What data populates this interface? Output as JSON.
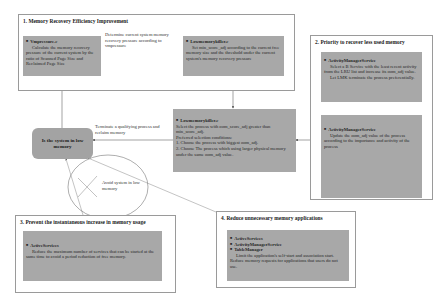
{
  "sections": [
    {
      "title": "1. Memory Recovery Efficiency Improvement",
      "boxes": [
        {
          "head": "Vmpressure.c",
          "lines": [
            "Calculate the memory recovery pressure of the current system by the ratio of Scanned Page Size and Reclaimed Page Size"
          ]
        },
        {
          "head": "Lowmemorykiller.c",
          "lines": [
            "Set min_score_adj according to the current free memory size and the threshold under the current system's memory recovery pressure"
          ]
        }
      ],
      "connector_label": "Determine current system memory recovery pressure according to vmpressure"
    },
    {
      "title": "2. Priority to recover less used memory",
      "boxes": [
        {
          "head": "ActivityManagerService",
          "lines": [
            "Select a B Service with the least recent activity from the LRU list and increase its oom_adj value.",
            "Let LMK terminate the process preferentially."
          ]
        },
        {
          "head": "ActivityManagerService",
          "lines": [
            "Update the oom_adj value of the process according to the importance and activity of the process"
          ]
        }
      ]
    },
    {
      "title": "3. Prevent the instantaneous increase in memory usage",
      "boxes": [
        {
          "head": "ActiveServices",
          "lines": [
            "Reduce the maximum number of services that can be started at the same time to avoid a period reduction of free memory."
          ]
        }
      ]
    },
    {
      "title": "4. Reduce unnecessary memory applications",
      "heads": [
        "ActiveServices",
        "ActivityManagerService",
        "TableManager"
      ],
      "lines": [
        "Limit the application's self-start and association start. Reduce memory requests for applications that users do not use."
      ]
    }
  ],
  "center_box": {
    "head": "Lowmemorykiller.c",
    "lines": [
      "Select the process with oom_score_adj greater than min_score_adj.",
      "Preferred selection conditions:",
      "1. Choose the process with biggest oom_adj.",
      "2. Choose The process which using larger physical memory under the same oom_adj value."
    ]
  },
  "decision": {
    "label": "Is the system in low memory"
  },
  "terminate_label": "Terminate a qualifying process and reclaim memory",
  "avoid_label": "Avoid system in low memory",
  "colors": {
    "box_gray": "#a8a8a8",
    "frame_border": "#9a9a9a",
    "arrow": "#444444"
  }
}
